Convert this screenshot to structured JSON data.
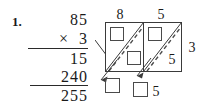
{
  "problem": {
    "number": "1.",
    "long_multiplication": {
      "multiplicand": "85",
      "multiplier_symbol": "×",
      "multiplier": "3",
      "partial_product_1": "15",
      "partial_product_2": "240",
      "total": "255",
      "multiplier_row": "×  3"
    }
  },
  "lattice": {
    "top_labels": [
      "8",
      "5"
    ],
    "right_label": "3",
    "cell_digit_lower_right": "5",
    "bottom_digit": "5",
    "empty_boxes": 5,
    "stroke_color": "#3a3a3a",
    "dash_color": "#4a4a4a",
    "box_color": "#4a4a4a"
  }
}
